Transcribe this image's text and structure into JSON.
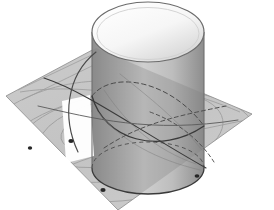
{
  "figure": {
    "background_color": "#ffffff",
    "canvas": {
      "width": 274,
      "height": 210
    }
  },
  "palette": {
    "background": "#ffffff",
    "plane_fill": "#b4b4b4",
    "plane_fill_light": "#c4c4c4",
    "plane_edge": "#8a8a8a",
    "cylinder_light": "#f2f2f2",
    "cylinder_mid": "#c9c9c9",
    "cylinder_dark": "#9a9a9a",
    "cylinder_edge": "#6e6e6e",
    "cap_light": "#fbfbfb",
    "cap_shadow": "#d2d2d2",
    "highlight_white": "#ffffff",
    "curve_solid": "#3a3a3a",
    "curve_dashed": "#4a4a4a",
    "contour_faint": "#9c9c9c",
    "marker_dot": "#262626"
  },
  "objects": {
    "plane": {
      "name": "inclined cutting plane",
      "shape": "quadrilateral",
      "opacity": 0.72,
      "vertices": [
        {
          "x": 6,
          "y": 96
        },
        {
          "x": 96,
          "y": 48
        },
        {
          "x": 252,
          "y": 114
        },
        {
          "x": 118,
          "y": 210
        }
      ]
    },
    "cylinder": {
      "name": "upright circular cylinder",
      "axis": "vertical",
      "left_x": 92,
      "right_x": 204,
      "top_center": {
        "x": 148,
        "y": 32
      },
      "bottom_center": {
        "x": 148,
        "y": 168
      },
      "cap_rx": 56,
      "cap_ry": 30,
      "base_rx": 56,
      "base_ry": 26
    },
    "highlight_patch": {
      "name": "specular highlight on cylinder wall",
      "color": "#ffffff",
      "vertices": [
        {
          "x": 62,
          "y": 101
        },
        {
          "x": 90,
          "y": 95
        },
        {
          "x": 94,
          "y": 156
        },
        {
          "x": 66,
          "y": 163
        }
      ]
    }
  },
  "curves": {
    "solid": [
      {
        "name": "intersection-ellipse-front",
        "style": "solid"
      },
      {
        "name": "intersection-ellipse-rear",
        "style": "solid"
      },
      {
        "name": "base-circle-front",
        "style": "solid"
      },
      {
        "name": "generatrix-left",
        "style": "solid"
      },
      {
        "name": "generatrix-right",
        "style": "solid"
      }
    ],
    "dashed": [
      {
        "name": "hidden-intersection-arc",
        "style": "dashed"
      },
      {
        "name": "hidden-base-arc",
        "style": "dashed"
      },
      {
        "name": "hidden-chord",
        "style": "dashed"
      }
    ],
    "faint_contours": [
      {
        "name": "plane-contour-ellipse-outer",
        "style": "faint"
      },
      {
        "name": "plane-contour-ellipse-mid",
        "style": "faint"
      },
      {
        "name": "plane-contour-ellipse-inner",
        "style": "faint"
      },
      {
        "name": "plane-grid-line-a",
        "style": "faint"
      },
      {
        "name": "plane-grid-line-b",
        "style": "faint"
      }
    ]
  },
  "markers": [
    {
      "name": "point-left",
      "x": 30,
      "y": 148
    },
    {
      "name": "point-center",
      "x": 71,
      "y": 141
    },
    {
      "name": "point-lower",
      "x": 103,
      "y": 190
    },
    {
      "name": "point-right",
      "x": 197,
      "y": 176
    }
  ]
}
